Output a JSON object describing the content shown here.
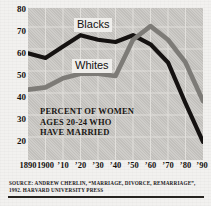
{
  "caption": {
    "line1": "PERCENT OF WOMEN",
    "line2": "AGES 20-24 WHO",
    "line3": "HAVE MARRIED"
  },
  "source": {
    "line1": "SOURCE: ANDREW CHERLIN, “MARRIAGE, DIVORCE, REMARRIAGE”,",
    "line2": "1992. HARVARD UNIVERSITY PRESS"
  },
  "colors": {
    "blacks_series": "#151211",
    "whites_series": "#7d7b77",
    "plot_background": "#c9c7c3",
    "page_background": "#f2f1ef",
    "grid": "#e6e4e0",
    "text": "#15120f"
  },
  "chart_data": {
    "type": "line",
    "title": "",
    "subtitle": "",
    "xlabel": "",
    "ylabel": "",
    "annotation": "PERCENT OF WOMEN AGES 20-24 WHO HAVE MARRIED",
    "grid": true,
    "legend_position": "inline-labels",
    "xlim": [
      1890,
      1990
    ],
    "ylim": [
      15,
      82
    ],
    "yticks": [
      80,
      70,
      60,
      50,
      40,
      30,
      20
    ],
    "ytick_labels": [
      "80",
      "70",
      "60",
      "50",
      "40",
      "30",
      "20"
    ],
    "xticks": [
      1890,
      1900,
      1910,
      1920,
      1930,
      1940,
      1950,
      1960,
      1970,
      1980,
      1990
    ],
    "xtick_labels": [
      "1890",
      "1900",
      "’10",
      "’20",
      "’30",
      "’40",
      "’50",
      "’60",
      "’70",
      "’80",
      "’90"
    ],
    "x": [
      1890,
      1900,
      1910,
      1920,
      1930,
      1940,
      1950,
      1960,
      1970,
      1980,
      1990
    ],
    "series": [
      {
        "name": "Blacks",
        "color": "#151211",
        "values": [
          62,
          60,
          65,
          70,
          68,
          67,
          70,
          66,
          58,
          40,
          23
        ]
      },
      {
        "name": "Whites",
        "color": "#7d7b77",
        "values": [
          46,
          47,
          51,
          53,
          53,
          52,
          68,
          74,
          68,
          58,
          41
        ]
      }
    ]
  }
}
